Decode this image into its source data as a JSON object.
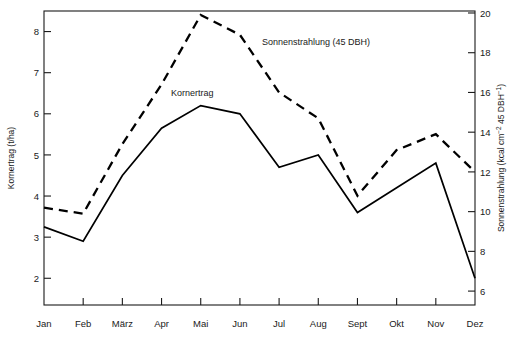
{
  "chart_data": {
    "type": "line",
    "title": "",
    "xlabel": "",
    "categories": [
      "Jan",
      "Feb",
      "März",
      "Apr",
      "Mai",
      "Jun",
      "Jul",
      "Aug",
      "Sept",
      "Okt",
      "Nov",
      "Dez"
    ],
    "grid": false,
    "legend_position": "inline-annotation",
    "axes": {
      "left": {
        "label": "Kornertrag (t/ha)",
        "unit": "t/ha",
        "ticks": [
          2,
          3,
          4,
          5,
          6,
          7,
          8
        ],
        "tick_labels": [
          "2",
          "3",
          "4",
          "5",
          "6",
          "7",
          "8"
        ],
        "ylim": [
          1.35,
          8.5
        ]
      },
      "right": {
        "label": "Sonnenstrahlung (kcal cm⁻² 45 DBH⁻¹)",
        "label_parts": {
          "prefix": "Sonnenstrahlung (kcal cm",
          "sup1": "−2",
          "mid": " 45 DBH",
          "sup2": "−1",
          "suffix": ")"
        },
        "unit": "kcal cm-2 45 DBH-1",
        "ticks": [
          6,
          8,
          10,
          12,
          14,
          16,
          18,
          20
        ],
        "tick_labels": [
          "6",
          "8",
          "10",
          "12",
          "14",
          "16",
          "18",
          "20"
        ],
        "ylim": [
          5.3,
          20.1
        ]
      }
    },
    "series": [
      {
        "name": "Kornertrag",
        "annotation": "Kornertrag",
        "axis": "left",
        "style": "solid",
        "color": "#000000",
        "values": [
          3.25,
          2.9,
          4.5,
          5.65,
          6.2,
          6.0,
          4.7,
          5.0,
          3.6,
          4.2,
          4.8,
          2.0
        ]
      },
      {
        "name": "Sonnenstrahlung (45 DBH)",
        "annotation": "Sonnenstrahlung (45 DBH)",
        "axis": "right",
        "style": "dashed",
        "color": "#000000",
        "values": [
          10.2,
          9.9,
          13.4,
          16.4,
          19.9,
          18.9,
          16.0,
          14.7,
          10.8,
          13.1,
          13.9,
          12.0
        ]
      }
    ],
    "annotations": [
      {
        "text": "Kornertrag",
        "x_px": 171,
        "y_px": 96
      },
      {
        "text": "Sonnenstrahlung (45 DBH)",
        "x_px": 262,
        "y_px": 45
      }
    ]
  },
  "colors": {
    "frame": "#1a1a1a",
    "series_primary": "#000000",
    "series_secondary": "#000000",
    "background": "#ffffff"
  }
}
